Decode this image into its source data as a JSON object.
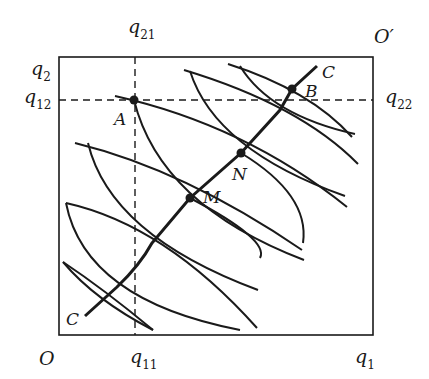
{
  "diagram": {
    "type": "edgeworth-box",
    "colors": {
      "ink": "#1a1a1a",
      "background": "#ffffff"
    },
    "origins": {
      "bottom_left": "O",
      "top_right": "O′"
    },
    "axis_labels": {
      "q1": {
        "base": "q",
        "sub": "1"
      },
      "q2": {
        "base": "q",
        "sub": "2"
      },
      "q11": {
        "base": "q",
        "sub": "11"
      },
      "q12": {
        "base": "q",
        "sub": "12"
      },
      "q21": {
        "base": "q",
        "sub": "21"
      },
      "q22": {
        "base": "q",
        "sub": "22"
      }
    },
    "points": {
      "A": "A",
      "M": "M",
      "N": "N",
      "B": "B"
    },
    "contract_curve": {
      "start_label": "C",
      "end_label": "C"
    }
  }
}
